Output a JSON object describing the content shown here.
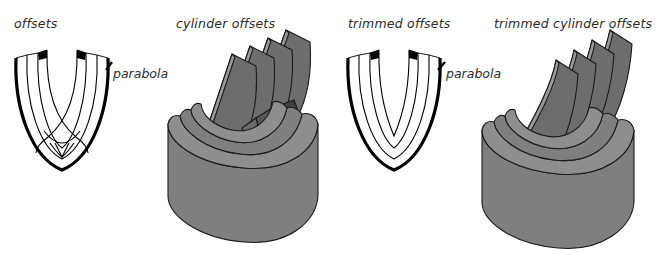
{
  "figure": {
    "background_color": "#ffffff",
    "panel_count": 4
  },
  "panels": [
    {
      "id": "offsets",
      "caption": "offsets",
      "annotation": "parabola",
      "kind": "2d-curves",
      "trimmed": false,
      "has_self_intersections": true,
      "curve_count": 4,
      "outer_curve_is_thick": true,
      "cusp_marker_count": 2,
      "cusp_marker_color": "#000000",
      "curve_color": "#000000"
    },
    {
      "id": "cylinder-offsets",
      "caption": "cylinder offsets",
      "annotation": "",
      "kind": "3d-surfaces",
      "trimmed": false,
      "has_self_intersections": true,
      "fin_count": 4,
      "body_fill": "#7f7f7f",
      "top_face_fill": "#8e8e8e",
      "fin_face_fill": "#6d6d6d",
      "intersection_fill": "#4a4a4a",
      "edge_color": "#1a1a1a"
    },
    {
      "id": "trimmed-offsets",
      "caption": "trimmed offsets",
      "annotation": "parabola",
      "kind": "2d-curves",
      "trimmed": true,
      "has_self_intersections": false,
      "curve_count": 4,
      "outer_curve_is_thick": true,
      "cusp_marker_count": 2,
      "cusp_marker_color": "#000000",
      "curve_color": "#000000"
    },
    {
      "id": "trimmed-cylinder-offsets",
      "caption": "trimmed cylinder offsets",
      "annotation": "",
      "kind": "3d-surfaces",
      "trimmed": true,
      "has_self_intersections": false,
      "fin_count": 4,
      "body_fill": "#7f7f7f",
      "top_face_fill": "#8e8e8e",
      "fin_face_fill": "#6d6d6d",
      "intersection_fill": "#4a4a4a",
      "edge_color": "#1a1a1a"
    }
  ]
}
